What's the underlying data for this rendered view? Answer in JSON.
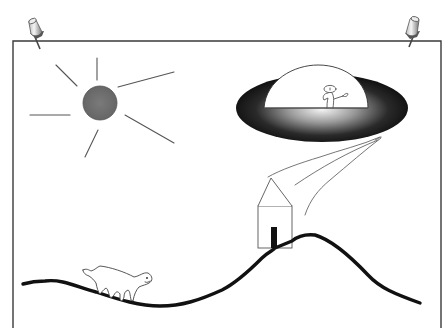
{
  "scene": {
    "description": "Pinned sheet of paper with a hand-drawn scene",
    "objects": [
      "paper",
      "pushpin-left",
      "pushpin-right",
      "sun",
      "ufo",
      "alien",
      "tractor-beam",
      "house",
      "hill",
      "cat"
    ]
  },
  "colors": {
    "background": "#ffffff",
    "paper_border": "#3a3a3a",
    "sun_fill": "#707070",
    "sun_rays": "#555555",
    "ufo_dark": "#111111",
    "ufo_light": "#f2f2f2",
    "ground": "#111111",
    "door": "#111111",
    "line": "#555555"
  }
}
